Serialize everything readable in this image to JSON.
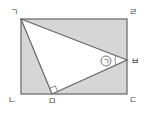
{
  "diagram": {
    "colors": {
      "shade": "#d6d6d6",
      "line": "#666666",
      "background": "#ffffff"
    },
    "vertices": {
      "giyeok": {
        "label": "ㄱ",
        "x": 21,
        "y": 19
      },
      "rieul": {
        "label": "ㄹ",
        "x": 127,
        "y": 19
      },
      "nieun": {
        "label": "ㄴ",
        "x": 21,
        "y": 94
      },
      "digeut": {
        "label": "ㄷ",
        "x": 127,
        "y": 94
      },
      "mieum": {
        "label": "ㅁ",
        "x": 52,
        "y": 94
      },
      "bieup": {
        "label": "ㅂ",
        "x": 127,
        "y": 60
      }
    },
    "angle_marker": {
      "label": "ㄱ",
      "circled": true
    },
    "right_angle_at": "ㅁ"
  }
}
